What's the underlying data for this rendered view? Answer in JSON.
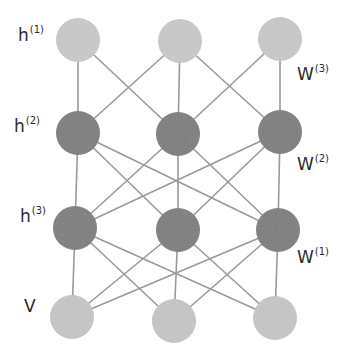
{
  "diagram": {
    "type": "neural-network",
    "colors": {
      "hidden_dark": "#7b7b7b",
      "visible_light": "#c6c6c6",
      "top_light": "#c9c9c9",
      "edge": "#9a9a9a",
      "text": "#2a2a2a"
    },
    "layers": [
      {
        "id": "h1",
        "base": "h",
        "sup": "(1)",
        "style": "light",
        "nodes": [
          {
            "x": 78,
            "y": 40
          },
          {
            "x": 180,
            "y": 41
          },
          {
            "x": 280,
            "y": 39
          }
        ]
      },
      {
        "id": "h2",
        "base": "h",
        "sup": "(2)",
        "style": "dark",
        "nodes": [
          {
            "x": 78,
            "y": 133
          },
          {
            "x": 178,
            "y": 134
          },
          {
            "x": 280,
            "y": 132
          }
        ]
      },
      {
        "id": "h3",
        "base": "h",
        "sup": "(3)",
        "style": "dark",
        "nodes": [
          {
            "x": 75,
            "y": 228
          },
          {
            "x": 178,
            "y": 230
          },
          {
            "x": 278,
            "y": 230
          }
        ]
      },
      {
        "id": "v",
        "base": "V",
        "sup": "",
        "style": "light",
        "nodes": [
          {
            "x": 72,
            "y": 317
          },
          {
            "x": 174,
            "y": 321
          },
          {
            "x": 275,
            "y": 318
          }
        ]
      }
    ],
    "layer_labels": [
      {
        "base": "h",
        "sup": "(1)",
        "x": 18,
        "y": 27
      },
      {
        "base": "h",
        "sup": "(2)",
        "x": 14,
        "y": 118
      },
      {
        "base": "h",
        "sup": "(3)",
        "x": 20,
        "y": 208
      },
      {
        "base": "V",
        "sup": "",
        "x": 24,
        "y": 298
      }
    ],
    "weight_labels": [
      {
        "base": "W",
        "sup": "(3)",
        "x": 297,
        "y": 66
      },
      {
        "base": "W",
        "sup": "(2)",
        "x": 297,
        "y": 156
      },
      {
        "base": "W",
        "sup": "(1)",
        "x": 297,
        "y": 249
      }
    ],
    "connections": [
      {
        "from": "h1",
        "to": "h2",
        "pairs": [
          [
            0,
            0
          ],
          [
            0,
            1
          ],
          [
            1,
            0
          ],
          [
            1,
            1
          ],
          [
            1,
            2
          ],
          [
            2,
            1
          ],
          [
            2,
            2
          ]
        ]
      },
      {
        "from": "h2",
        "to": "h3",
        "pairs": [
          [
            0,
            0
          ],
          [
            0,
            1
          ],
          [
            0,
            2
          ],
          [
            1,
            0
          ],
          [
            1,
            1
          ],
          [
            1,
            2
          ],
          [
            2,
            0
          ],
          [
            2,
            1
          ],
          [
            2,
            2
          ]
        ]
      },
      {
        "from": "h3",
        "to": "v",
        "pairs": [
          [
            0,
            0
          ],
          [
            0,
            1
          ],
          [
            0,
            2
          ],
          [
            1,
            0
          ],
          [
            1,
            1
          ],
          [
            1,
            2
          ],
          [
            2,
            0
          ],
          [
            2,
            1
          ],
          [
            2,
            2
          ]
        ]
      }
    ],
    "node_radius": 22
  }
}
